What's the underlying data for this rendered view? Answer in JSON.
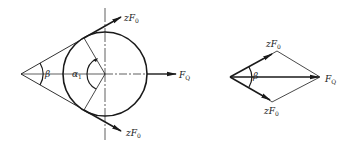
{
  "figure": {
    "left_diagram": {
      "description": "Belt drive pulley with tangent belt tensions and resultant shaft load",
      "labels": {
        "upper_force": "zF",
        "upper_force_sub": "0",
        "lower_force": "zF",
        "lower_force_sub": "0",
        "resultant": "F",
        "resultant_sub": "Q",
        "wrap_angle": "α",
        "wrap_angle_sub": "1",
        "belt_angle": "β"
      }
    },
    "right_diagram": {
      "description": "Force parallelogram (vector sum) of the two belt forces giving resultant F_Q",
      "labels": {
        "upper_force": "zF",
        "upper_force_sub": "0",
        "lower_force": "zF",
        "lower_force_sub": "0",
        "resultant": "F",
        "resultant_sub": "Q",
        "belt_angle": "β"
      }
    },
    "colors": {
      "line": "#1a1a1a",
      "background": "#ffffff"
    }
  }
}
